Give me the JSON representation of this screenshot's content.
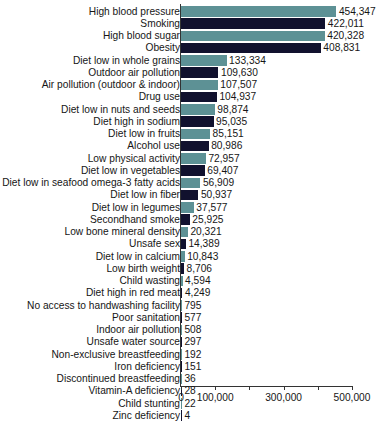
{
  "chart_data": {
    "type": "bar",
    "orientation": "horizontal",
    "title": "",
    "subtitle": "",
    "xlabel": "",
    "ylabel": "",
    "xlim": [
      0,
      520000
    ],
    "grid": false,
    "legend": null,
    "axis": {
      "major_ticks": [
        0,
        100000,
        300000,
        500000
      ],
      "minor_ticks": [
        200000,
        400000
      ],
      "tick_labels": [
        "0",
        "100,000",
        "300,000",
        "500,000"
      ]
    },
    "colors": {
      "bar_teal": "#5d9195",
      "bar_navy": "#11112e",
      "text": "#161616",
      "axis": "#333333",
      "background": "#ffffff"
    },
    "categories": [
      "High blood pressure",
      "Smoking",
      "High blood sugar",
      "Obesity",
      "Diet low in whole grains",
      "Outdoor air pollution",
      "Air pollution (outdoor & indoor)",
      "Drug use",
      "Diet low in nuts and seeds",
      "Diet high in sodium",
      "Diet low in fruits",
      "Alcohol use",
      "Low physical activity",
      "Diet low in vegetables",
      "Diet low in seafood omega-3 fatty acids",
      "Diet low in fiber",
      "Diet low in legumes",
      "Secondhand smoke",
      "Low bone mineral density",
      "Unsafe sex",
      "Diet low in calcium",
      "Low birth weight",
      "Child wasting",
      "Diet high in red meat",
      "No access to handwashing facility",
      "Poor sanitation",
      "Indoor air pollution",
      "Unsafe water source",
      "Non-exclusive breastfeeding",
      "Iron deficiency",
      "Discontinued breastfeeding",
      "Vitamin-A deficiency",
      "Child stunting",
      "Zinc deficiency"
    ],
    "values": [
      454347,
      422011,
      420328,
      408831,
      133334,
      109630,
      107507,
      104937,
      98874,
      95035,
      85151,
      80986,
      72957,
      69407,
      56909,
      50937,
      37577,
      25925,
      20321,
      14389,
      10843,
      8706,
      4594,
      4249,
      795,
      577,
      508,
      297,
      192,
      151,
      36,
      28,
      22,
      4
    ],
    "value_labels": [
      "454,347",
      "422,011",
      "420,328",
      "408,831",
      "133,334",
      "109,630",
      "107,507",
      "104,937",
      "98,874",
      "95,035",
      "85,151",
      "80,986",
      "72,957",
      "69,407",
      "56,909",
      "50,937",
      "37,577",
      "25,925",
      "20,321",
      "14,389",
      "10,843",
      "8,706",
      "4,594",
      "4,249",
      "795",
      "577",
      "508",
      "297",
      "192",
      "151",
      "36",
      "28",
      "22",
      "4"
    ]
  }
}
